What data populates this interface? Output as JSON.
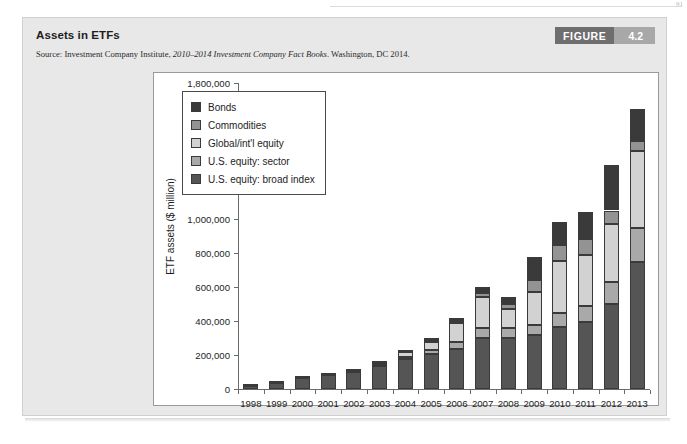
{
  "page": {
    "number": "91"
  },
  "figure": {
    "title": "Assets in ETFs",
    "source_prefix": "Source: Investment Company Institute,",
    "source_italic": "2010–2014 Investment Company Fact Books",
    "source_suffix": ". Washington, DC 2014.",
    "badge_word": "FIGURE",
    "badge_number": "4.2"
  },
  "colors": {
    "bonds": "#3a3a3a",
    "commodities": "#939393",
    "global_intl_equity": "#d2d2d2",
    "us_equity_sector": "#a9a9a9",
    "us_equity_broad_index": "#555555",
    "panel_bg": "#e8e8e8",
    "chart_bg": "#ffffff",
    "axis": "#6b6b6b",
    "badge_dark": "#6e6e6e",
    "badge_light": "#a8a8a8"
  },
  "chart_data": {
    "type": "bar",
    "stacked": true,
    "title": "Assets in ETFs",
    "xlabel": "",
    "ylabel": "ETF assets ($ million)",
    "ylim": [
      0,
      1800000
    ],
    "yticks": [
      0,
      200000,
      400000,
      600000,
      800000,
      1000000,
      1200000,
      1400000,
      1600000,
      1800000
    ],
    "ytick_labels": [
      "0",
      "200,000",
      "400,000",
      "600,000",
      "800,000",
      "1,000,000",
      "1,200,000",
      "1,400,000",
      "1,600,000",
      "1,800,000"
    ],
    "grid": false,
    "legend_position": "upper-left-inside",
    "categories": [
      "1998",
      "1999",
      "2000",
      "2001",
      "2002",
      "2003",
      "2004",
      "2005",
      "2006",
      "2007",
      "2008",
      "2009",
      "2010",
      "2011",
      "2012",
      "2013"
    ],
    "stack_order_bottom_to_top": [
      "U.S. equity: broad index",
      "U.S. equity: sector",
      "Global/int'l equity",
      "Commodities",
      "Bonds"
    ],
    "series": [
      {
        "name": "U.S. equity: broad index",
        "color": "#555555",
        "values": [
          15000,
          33000,
          63000,
          80000,
          98000,
          133000,
          176000,
          204000,
          233000,
          300000,
          300000,
          315000,
          365000,
          395000,
          500000,
          750000
        ]
      },
      {
        "name": "U.S. equity: sector",
        "color": "#a9a9a9",
        "values": [
          0,
          0,
          3000,
          3000,
          4000,
          7000,
          15000,
          24000,
          41000,
          59000,
          58000,
          60000,
          80000,
          95000,
          130000,
          200000
        ]
      },
      {
        "name": "Global/int'l equity",
        "color": "#d2d2d2",
        "values": [
          1000,
          1000,
          2000,
          2000,
          4000,
          10000,
          27000,
          51000,
          112000,
          180000,
          110000,
          195000,
          310000,
          300000,
          340000,
          450000
        ]
      },
      {
        "name": "Commodities",
        "color": "#939393",
        "values": [
          0,
          0,
          0,
          0,
          0,
          1000,
          2000,
          5000,
          11000,
          28000,
          34000,
          70000,
          90000,
          95000,
          80000,
          60000
        ]
      },
      {
        "name": "Bonds",
        "color": "#3a3a3a",
        "values": [
          0,
          0,
          0,
          0,
          3000,
          5000,
          6000,
          16000,
          21000,
          34000,
          38000,
          135000,
          135000,
          155000,
          270000,
          190000
        ]
      }
    ],
    "totals": [
      16000,
      34000,
      68000,
      85000,
      109000,
      156000,
      226000,
      300000,
      418000,
      601000,
      540000,
      775000,
      980000,
      1040000,
      1320000,
      1650000
    ]
  },
  "legend": {
    "items": [
      {
        "label": "Bonds",
        "color": "#3a3a3a"
      },
      {
        "label": "Commodities",
        "color": "#939393"
      },
      {
        "label": "Global/int'l equity",
        "color": "#d2d2d2"
      },
      {
        "label": "U.S. equity: sector",
        "color": "#a9a9a9"
      },
      {
        "label": "U.S. equity: broad index",
        "color": "#555555"
      }
    ]
  }
}
